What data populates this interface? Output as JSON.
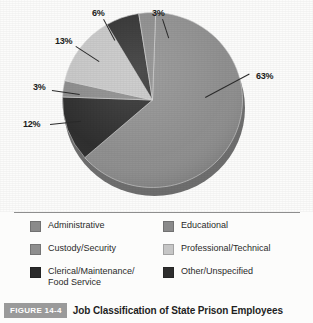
{
  "figure": {
    "badge": "FIGURE 14-4",
    "caption": "Job Classification of State Prison Employees"
  },
  "colors": {
    "administrative": "#8a8a8a",
    "custody_security": "#8e8e8e",
    "clerical": "#2b2b2b",
    "educational": "#8a8a8a",
    "professional_technical": "#c6c6c6",
    "other_unspecified": "#2e2e2e",
    "pie_depth": "#6f6f6f",
    "background": "#fcfcfb",
    "divider": "#8e8e8e",
    "label_text": "#1c1c1c",
    "badge_bg": "#9a9a9a"
  },
  "legend": {
    "left_column": [
      {
        "label": "Administrative",
        "color": "#8a8a8a"
      },
      {
        "label": "Custody/Security",
        "color": "#8e8e8e"
      },
      {
        "label": "Clerical/Maintenance/\nFood Service",
        "color": "#2b2b2b"
      }
    ],
    "right_column": [
      {
        "label": "Educational",
        "color": "#8a8a8a"
      },
      {
        "label": "Professional/Technical",
        "color": "#c6c6c6"
      },
      {
        "label": "Other/Unspecified",
        "color": "#2e2e2e"
      }
    ]
  },
  "callouts": [
    {
      "text": "6%",
      "x": 92,
      "y": 8
    },
    {
      "text": "3%",
      "x": 152,
      "y": 8
    },
    {
      "text": "13%",
      "x": 61,
      "y": 36
    },
    {
      "text": "3%",
      "x": 35,
      "y": 82
    },
    {
      "text": "12%",
      "x": 25,
      "y": 119
    },
    {
      "text": "63%",
      "x": 255,
      "y": 71
    }
  ],
  "chart_data": {
    "type": "pie",
    "title": "Job Classification of State Prison Employees",
    "labels": [
      "Custody/Security",
      "Clerical/Maintenance/Food Service",
      "Administrative",
      "Professional/Technical",
      "Other/Unspecified",
      "Educational"
    ],
    "values": [
      63,
      12,
      3,
      13,
      6,
      3
    ],
    "value_labels": [
      "63%",
      "12%",
      "3%",
      "13%",
      "6%",
      "3%"
    ],
    "units": "percent",
    "total": 100,
    "colors": [
      "#8e8e8e",
      "#2b2b2b",
      "#8a8a8a",
      "#c6c6c6",
      "#2e2e2e",
      "#8a8a8a"
    ],
    "legend_position": "bottom",
    "grid": false,
    "xlabel": "",
    "ylabel": ""
  }
}
